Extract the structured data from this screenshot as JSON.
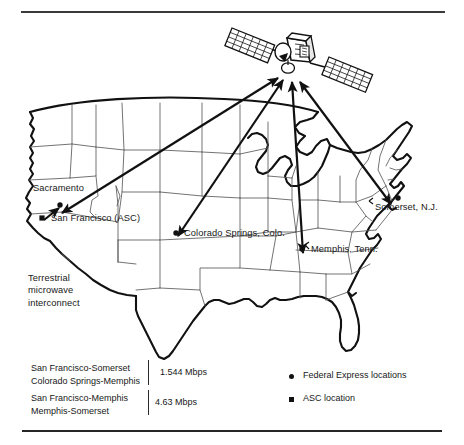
{
  "figure": {
    "type": "network-map"
  },
  "satellite": {
    "name": "communications-satellite",
    "panels": 2
  },
  "map": {
    "cities": [
      {
        "id": "sacramento",
        "label": "Sacramento",
        "marker": "dot",
        "marker_x": 60,
        "marker_y": 205,
        "label_x": 33,
        "label_y": 186
      },
      {
        "id": "san-francisco",
        "label": "San Francisco (ASC)",
        "marker": "square",
        "marker_x": 42,
        "marker_y": 218,
        "label_x": 51,
        "label_y": 212
      },
      {
        "id": "colorado-springs",
        "label": "Colorado Springs, Colo.",
        "marker": "dot",
        "marker_x": 176,
        "marker_y": 233,
        "label_x": 184,
        "label_y": 227
      },
      {
        "id": "memphis",
        "label": "Memphis, Tenn.",
        "marker": "dot",
        "marker_x": 302,
        "marker_y": 249,
        "label_x": 310,
        "label_y": 243
      },
      {
        "id": "somerset",
        "label": "Somerset, N.J.",
        "marker": "dot",
        "marker_x": 398,
        "marker_y": 198,
        "label_x": 373,
        "label_y": 200
      }
    ],
    "annotation": {
      "id": "terrestrial-microwave",
      "lines": [
        "Terrestrial",
        "microwave",
        "interconnect"
      ],
      "x": 28,
      "y": 276
    },
    "links": [
      {
        "from": "san-francisco",
        "to": "satellite",
        "arrow": "double"
      },
      {
        "from": "colorado-springs",
        "to": "satellite",
        "arrow": "double"
      },
      {
        "from": "memphis",
        "to": "satellite",
        "arrow": "double"
      },
      {
        "from": "somerset",
        "to": "satellite",
        "arrow": "double"
      }
    ]
  },
  "bandwidth_table": {
    "rows": [
      {
        "routes": "San Francisco-Somerset\nColorado Springs-Memphis",
        "rate": "1.544  Mbps"
      },
      {
        "routes": "San Francisco-Memphis\nMemphis-Somerset",
        "rate": "4.63  Mbps"
      }
    ]
  },
  "key": {
    "items": [
      {
        "marker": "dot",
        "label": "Federal Express locations"
      },
      {
        "marker": "square",
        "label": "ASC location"
      }
    ]
  },
  "colors": {
    "ink": "#111111",
    "rule": "#3a3a3a",
    "state_border": "#555555",
    "coast": "#111111",
    "paper": "#ffffff"
  }
}
